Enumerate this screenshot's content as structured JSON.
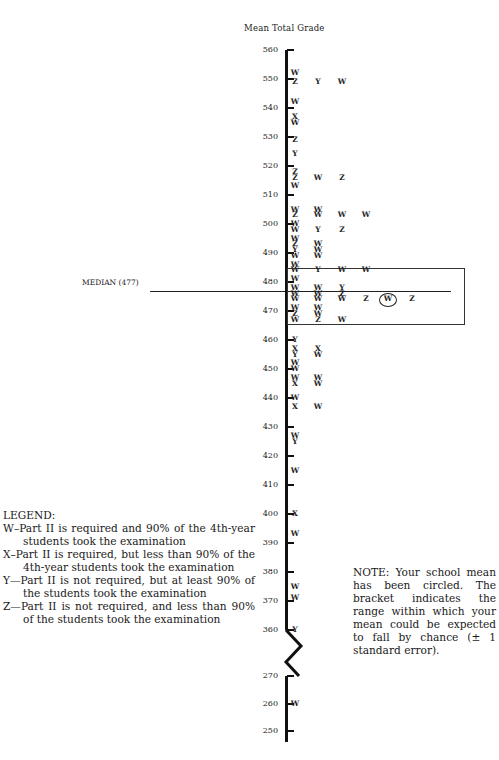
{
  "chart_data": {
    "type": "scatter",
    "title": "Mean Total Grade",
    "ylabel": "Mean Total Grade",
    "xlabel": "",
    "y_ticks_upper": [
      560,
      550,
      540,
      530,
      520,
      510,
      500,
      490,
      480,
      470,
      460,
      450,
      440,
      430,
      420,
      410,
      400,
      390,
      380,
      370,
      360
    ],
    "y_ticks_lower": [
      270,
      260,
      250
    ],
    "axis_break": "between 360 and 270",
    "median": {
      "label": "MEDIAN (477)",
      "value": 477
    },
    "bracket_range": [
      466,
      485
    ],
    "circled_point": {
      "letter": "W",
      "value": 474
    },
    "points": [
      {
        "col": 0,
        "y": 552,
        "l": "W"
      },
      {
        "col": 0,
        "y": 549,
        "l": "Z"
      },
      {
        "col": 1,
        "y": 549,
        "l": "Y"
      },
      {
        "col": 2,
        "y": 549,
        "l": "W"
      },
      {
        "col": 0,
        "y": 542,
        "l": "W"
      },
      {
        "col": 0,
        "y": 537,
        "l": "X"
      },
      {
        "col": 0,
        "y": 535,
        "l": "W"
      },
      {
        "col": 0,
        "y": 529,
        "l": "Z"
      },
      {
        "col": 0,
        "y": 524,
        "l": "Y"
      },
      {
        "col": 0,
        "y": 518,
        "l": "Z"
      },
      {
        "col": 0,
        "y": 516,
        "l": "Z"
      },
      {
        "col": 1,
        "y": 516,
        "l": "W"
      },
      {
        "col": 2,
        "y": 516,
        "l": "Z"
      },
      {
        "col": 0,
        "y": 513,
        "l": "W"
      },
      {
        "col": 0,
        "y": 505,
        "l": "W"
      },
      {
        "col": 1,
        "y": 505,
        "l": "W"
      },
      {
        "col": 0,
        "y": 503,
        "l": "Z"
      },
      {
        "col": 1,
        "y": 503,
        "l": "W"
      },
      {
        "col": 2,
        "y": 503,
        "l": "W"
      },
      {
        "col": 3,
        "y": 503,
        "l": "W"
      },
      {
        "col": 0,
        "y": 500,
        "l": "W"
      },
      {
        "col": 0,
        "y": 498,
        "l": "W"
      },
      {
        "col": 1,
        "y": 498,
        "l": "Y"
      },
      {
        "col": 2,
        "y": 498,
        "l": "Z"
      },
      {
        "col": 0,
        "y": 495,
        "l": "W"
      },
      {
        "col": 0,
        "y": 493,
        "l": "Z"
      },
      {
        "col": 1,
        "y": 493,
        "l": "W"
      },
      {
        "col": 0,
        "y": 491,
        "l": "Y"
      },
      {
        "col": 1,
        "y": 491,
        "l": "W"
      },
      {
        "col": 0,
        "y": 489,
        "l": "W"
      },
      {
        "col": 1,
        "y": 489,
        "l": "W"
      },
      {
        "col": 0,
        "y": 486,
        "l": "W"
      },
      {
        "col": 0,
        "y": 484,
        "l": "W"
      },
      {
        "col": 1,
        "y": 484,
        "l": "Y"
      },
      {
        "col": 2,
        "y": 484,
        "l": "W"
      },
      {
        "col": 3,
        "y": 484,
        "l": "W"
      },
      {
        "col": 0,
        "y": 481,
        "l": "W"
      },
      {
        "col": 0,
        "y": 478,
        "l": "W"
      },
      {
        "col": 1,
        "y": 478,
        "l": "W"
      },
      {
        "col": 2,
        "y": 478,
        "l": "Y"
      },
      {
        "col": 0,
        "y": 476,
        "l": "W"
      },
      {
        "col": 1,
        "y": 476,
        "l": "W"
      },
      {
        "col": 2,
        "y": 476,
        "l": "Z"
      },
      {
        "col": 0,
        "y": 474,
        "l": "W"
      },
      {
        "col": 1,
        "y": 474,
        "l": "W"
      },
      {
        "col": 2,
        "y": 474,
        "l": "W"
      },
      {
        "col": 3,
        "y": 474,
        "l": "Z"
      },
      {
        "col": 4,
        "y": 474,
        "l": "W"
      },
      {
        "col": 5,
        "y": 474,
        "l": "Z"
      },
      {
        "col": 0,
        "y": 471,
        "l": "W"
      },
      {
        "col": 1,
        "y": 471,
        "l": "W"
      },
      {
        "col": 0,
        "y": 469,
        "l": "Z"
      },
      {
        "col": 1,
        "y": 469,
        "l": "W"
      },
      {
        "col": 0,
        "y": 467,
        "l": "W"
      },
      {
        "col": 1,
        "y": 467,
        "l": "Z"
      },
      {
        "col": 2,
        "y": 467,
        "l": "W"
      },
      {
        "col": 0,
        "y": 460,
        "l": "Y"
      },
      {
        "col": 0,
        "y": 457,
        "l": "X"
      },
      {
        "col": 1,
        "y": 457,
        "l": "X"
      },
      {
        "col": 0,
        "y": 455,
        "l": "Y"
      },
      {
        "col": 1,
        "y": 455,
        "l": "W"
      },
      {
        "col": 0,
        "y": 452,
        "l": "W"
      },
      {
        "col": 0,
        "y": 450,
        "l": "W"
      },
      {
        "col": 0,
        "y": 447,
        "l": "W"
      },
      {
        "col": 1,
        "y": 447,
        "l": "W"
      },
      {
        "col": 0,
        "y": 445,
        "l": "X"
      },
      {
        "col": 1,
        "y": 445,
        "l": "W"
      },
      {
        "col": 0,
        "y": 440,
        "l": "W"
      },
      {
        "col": 0,
        "y": 437,
        "l": "X"
      },
      {
        "col": 1,
        "y": 437,
        "l": "W"
      },
      {
        "col": 0,
        "y": 427,
        "l": "W"
      },
      {
        "col": 0,
        "y": 425,
        "l": "Y"
      },
      {
        "col": 0,
        "y": 415,
        "l": "W"
      },
      {
        "col": 0,
        "y": 400,
        "l": "X"
      },
      {
        "col": 0,
        "y": 393,
        "l": "W"
      },
      {
        "col": 0,
        "y": 375,
        "l": "W"
      },
      {
        "col": 0,
        "y": 371,
        "l": "W"
      },
      {
        "col": 0,
        "y": 360,
        "l": "Y"
      },
      {
        "col": 0,
        "y": 260,
        "l": "W"
      }
    ]
  },
  "legend": {
    "heading": "LEGEND:",
    "items": [
      "W–Part II is required and 90% of the 4th-year students took the examination",
      "X–Part II is required, but less than 90% of the 4th-year students took the examination",
      "Y—Part II is not required, but at least 90% of the students took the examination",
      "Z—Part II is not required, and less than 90% of the students took the examination"
    ]
  },
  "note": "NOTE: Your school mean has been circled. The bracket indicates the range within which your mean could be expected to fall by chance (± 1 standard error)."
}
